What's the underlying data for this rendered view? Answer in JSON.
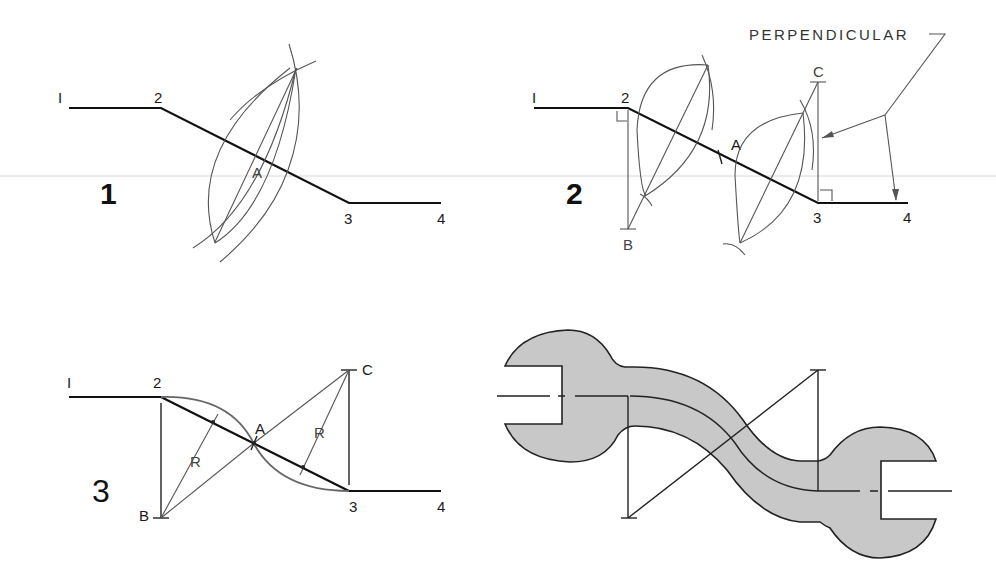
{
  "figure": {
    "colors": {
      "line": "#111111",
      "construction": "#555555",
      "wrench_fill": "#c8c8c8",
      "faint_rule": "#d8d8d8"
    }
  },
  "panels": [
    {
      "step_label": "1",
      "points": {
        "p1": "I",
        "p2": "2",
        "p3": "3",
        "p4": "4",
        "mid": "A"
      }
    },
    {
      "step_label": "2",
      "points": {
        "p1": "I",
        "p2": "2",
        "p3": "3",
        "p4": "4",
        "mid": "A",
        "center_b": "B",
        "center_c": "C"
      },
      "annotation": "PERPENDICULAR"
    },
    {
      "step_label": "3",
      "points": {
        "p1": "I",
        "p2": "2",
        "p3": "3",
        "p4": "4",
        "mid": "A",
        "center_b": "B",
        "center_c": "C"
      },
      "radius_labels": [
        "R",
        "R"
      ]
    },
    {
      "step_label": "",
      "example": "wrench"
    }
  ]
}
